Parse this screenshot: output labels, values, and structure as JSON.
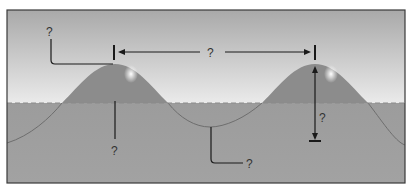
{
  "diagram": {
    "labels": {
      "crest": "?",
      "wavelength": "?",
      "still_water_depth": "?",
      "wave_height": "?",
      "trough": "?"
    },
    "colors": {
      "sky_top": "#a8a8a8",
      "sky_bottom": "#e8e8e8",
      "water": "#9a9a9a",
      "wave_above": "#8c8c8c",
      "wave_line": "#6e6e6e",
      "still_water_line": "#8a8a8a",
      "frame": "#3a3a3a",
      "annotation": "#1a1a1a",
      "foam": "#f2f2f2"
    }
  }
}
